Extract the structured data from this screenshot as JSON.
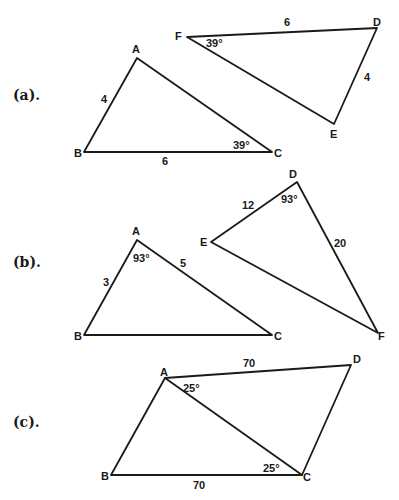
{
  "figures": [
    {
      "label": "(a).",
      "triangles": [
        {
          "vertices": {
            "A": [
              137,
              58
            ],
            "B": [
              84,
              152
            ],
            "C": [
              272,
              152
            ]
          },
          "vertex_labels": {
            "A": "A",
            "B": "B",
            "C": "C"
          },
          "side_labels": {
            "AB": "4",
            "BC": "6"
          },
          "angle_labels": {
            "C": "39°"
          }
        },
        {
          "vertices": {
            "F": [
              187,
              37
            ],
            "D": [
              377,
              28
            ],
            "E": [
              334,
              124
            ]
          },
          "vertex_labels": {
            "F": "F",
            "D": "D",
            "E": "E"
          },
          "side_labels": {
            "FD": "6",
            "DE": "4"
          },
          "angle_labels": {
            "F": "39°"
          }
        }
      ]
    },
    {
      "label": "(b).",
      "triangles": [
        {
          "vertices": {
            "A": [
              137,
              240
            ],
            "B": [
              84,
              335
            ],
            "C": [
              272,
              335
            ]
          },
          "vertex_labels": {
            "A": "A",
            "B": "B",
            "C": "C"
          },
          "side_labels": {
            "AB": "3",
            "AC": "5"
          },
          "angle_labels": {
            "A": "93°"
          }
        },
        {
          "vertices": {
            "D": [
              297,
              182
            ],
            "E": [
              211,
              242
            ],
            "F": [
              378,
              333
            ]
          },
          "vertex_labels": {
            "D": "D",
            "E": "E",
            "F": "F"
          },
          "side_labels": {
            "DE": "12",
            "DF": "20"
          },
          "angle_labels": {
            "D": "93°"
          }
        }
      ]
    },
    {
      "label": "(c).",
      "quadrilateral": {
        "vertices": {
          "A": [
            165,
            378
          ],
          "D": [
            351,
            365
          ],
          "B": [
            111,
            475
          ],
          "C": [
            302,
            475
          ]
        },
        "vertex_labels": {
          "A": "A",
          "B": "B",
          "C": "C",
          "D": "D"
        },
        "side_labels": {
          "AD": "70",
          "BC": "70"
        },
        "angle_labels": {
          "A": "25°",
          "C": "25°"
        },
        "diagonal": "AC"
      }
    }
  ]
}
